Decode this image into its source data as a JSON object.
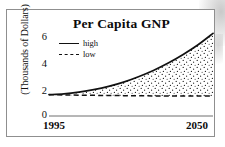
{
  "figure": {
    "frame_color": "#8f8f8f",
    "background": "#ffffff"
  },
  "chart_data": {
    "type": "area",
    "title": "Per Capita GNP",
    "xlabel": "",
    "ylabel": "(Thousands of Dollars)",
    "grid": false,
    "legend_position": "upper-left",
    "xlim": [
      1995,
      2050
    ],
    "ylim": [
      0,
      6.6
    ],
    "xticks": [
      1995,
      2050
    ],
    "xticklabels": [
      "1995",
      "2050"
    ],
    "yticks": [
      0,
      2,
      4,
      6
    ],
    "yticklabels": [
      "0",
      "2",
      "4",
      "6"
    ],
    "fill_between": {
      "upper_series": "high",
      "lower_series": "low",
      "pattern": "stipple-dots",
      "pattern_color": "#1a1a1a"
    },
    "x": [
      1995,
      2000,
      2005,
      2010,
      2015,
      2020,
      2025,
      2030,
      2035,
      2040,
      2045,
      2050
    ],
    "series": [
      {
        "name": "high",
        "style": "solid",
        "color": "#111111",
        "values": [
          1.5,
          1.56,
          1.68,
          1.85,
          2.08,
          2.38,
          2.76,
          3.2,
          3.72,
          4.32,
          5.0,
          5.8
        ]
      },
      {
        "name": "low",
        "style": "dashed",
        "color": "#111111",
        "values": [
          1.5,
          1.48,
          1.46,
          1.45,
          1.44,
          1.43,
          1.42,
          1.41,
          1.4,
          1.4,
          1.4,
          1.4
        ]
      }
    ]
  },
  "legend": {
    "items": [
      {
        "label": "high",
        "style": "solid"
      },
      {
        "label": "low",
        "style": "dashed"
      }
    ]
  }
}
